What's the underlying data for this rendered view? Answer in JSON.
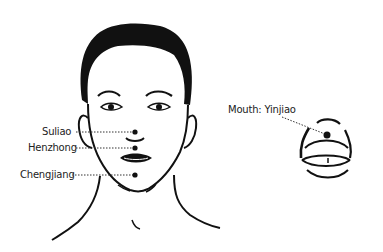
{
  "diagram": {
    "labels": [
      {
        "id": "suliao",
        "text": "Suliao"
      },
      {
        "id": "henzhong",
        "text": "Henzhong"
      },
      {
        "id": "chengjiang",
        "text": "Chengjiang"
      },
      {
        "id": "yinjiao",
        "text": "Mouth: Yinjiao"
      }
    ],
    "colors": {
      "line": "#111111",
      "text": "#222222",
      "background": "#ffffff"
    }
  }
}
